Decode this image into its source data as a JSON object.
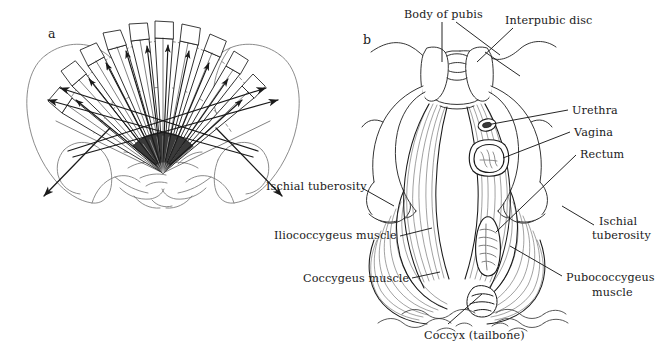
{
  "figure": {
    "background_color": "#ffffff",
    "ink_color": "#1a1a1a"
  },
  "panels": [
    {
      "id": "a",
      "letter": "a",
      "caption": "Fan of forces radiating across the pelvic outlet"
    },
    {
      "id": "b",
      "letter": "b",
      "caption": "Female pelvic floor musculature viewed from below"
    }
  ],
  "labels": {
    "body_of_pubis": "Body of pubis",
    "interpubic_disc": "Interpubic disc",
    "urethra": "Urethra",
    "vagina": "Vagina",
    "rectum": "Rectum",
    "ischial_tuberosity_left": "Ischial tuberosity",
    "ischial_tuberosity_right_line1": "Ischial",
    "ischial_tuberosity_right_line2": "tuberosity",
    "iliococcygeus_muscle": "Iliococcygeus muscle",
    "coccygeus_muscle": "Coccygeus muscle",
    "pubococcygeus_muscle_line1": "Pubococcygeus",
    "pubococcygeus_muscle_line2": "muscle",
    "coccyx_tailbone": "Coccyx (tailbone)"
  },
  "label_positions": {
    "body_of_pubis": {
      "x": 404,
      "y": 8,
      "anchor": "left"
    },
    "interpubic_disc": {
      "x": 505,
      "y": 14,
      "anchor": "left"
    },
    "urethra": {
      "x": 572,
      "y": 104,
      "anchor": "left"
    },
    "vagina": {
      "x": 574,
      "y": 126,
      "anchor": "left"
    },
    "rectum": {
      "x": 580,
      "y": 148,
      "anchor": "left"
    },
    "ischial_tuberosity_left": {
      "x": 266,
      "y": 180,
      "anchor": "left"
    },
    "ischial_tuberosity_right": {
      "x": 596,
      "y": 221,
      "anchor": "left"
    },
    "iliococcygeus_muscle": {
      "x": 274,
      "y": 229,
      "anchor": "left"
    },
    "coccygeus_muscle": {
      "x": 303,
      "y": 272,
      "anchor": "left"
    },
    "pubococcygeus_muscle": {
      "x": 566,
      "y": 271,
      "anchor": "left"
    },
    "coccyx_tailbone": {
      "x": 424,
      "y": 329,
      "anchor": "left"
    },
    "panel_a_letter": {
      "x": 48,
      "y": 27,
      "anchor": "left"
    },
    "panel_b_letter": {
      "x": 363,
      "y": 33,
      "anchor": "left"
    }
  },
  "panel_a": {
    "fan_hub": {
      "x": 163,
      "y": 173
    },
    "blade_count": 11,
    "description": "Radiating fan of arrowed blades from a dark hub at the coccyx spreading to the pelvic brim, with two long outward arrows to the left and right iliac crests."
  },
  "panel_b": {
    "structures": [
      "body of pubis",
      "interpubic disc",
      "urethra",
      "vagina",
      "rectum",
      "ischial tuberosity",
      "iliococcygeus muscle",
      "coccygeus muscle",
      "pubococcygeus muscle",
      "coccyx"
    ]
  }
}
